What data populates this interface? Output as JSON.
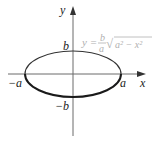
{
  "figure": {
    "type": "ellipse-graph",
    "axes": {
      "x_label": "x",
      "y_label": "y"
    },
    "points": {
      "left": "−a",
      "right": "a",
      "top": "b",
      "bottom": "−b"
    },
    "equation": {
      "lhs": "y =",
      "frac_num": "b",
      "frac_den": "a",
      "radical": "√",
      "radicand": "a² − x²"
    },
    "colors": {
      "axis": "#6a6a6a",
      "curve": "#333333",
      "curve_lower": "#1a1a1a",
      "equation": "#b0b0b0"
    }
  }
}
